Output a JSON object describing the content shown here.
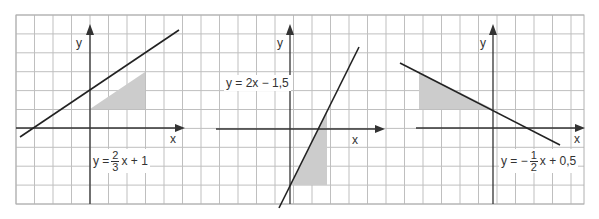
{
  "grid": {
    "left": 16,
    "top": 15,
    "right": 584,
    "bottom": 204,
    "cell_w": 18.5,
    "cell_h": 18.9,
    "line_color": "#bfbfbf",
    "border_color": "#b0b0b0"
  },
  "colors": {
    "line": "#222222",
    "axis": "#333333",
    "shade": "#cccccc"
  },
  "graphs": [
    {
      "id": "graph-1",
      "equation": "y = 2/3 x + 1",
      "label": {
        "prefix": "y = ",
        "frac_num": "2",
        "frac_den": "3",
        "suffix": "x + 1"
      },
      "axis_labels": {
        "x": "x",
        "y": "y"
      },
      "origin_px": [
        90,
        128
      ],
      "line_px": [
        [
          20,
          137
        ],
        [
          179,
          30
        ]
      ],
      "shade_px": [
        [
          90,
          109
        ],
        [
          145,
          72
        ],
        [
          145,
          109
        ]
      ]
    },
    {
      "id": "graph-2",
      "equation": "y = 2x − 1,5",
      "label": {
        "text": "y = 2x − 1,5"
      },
      "axis_labels": {
        "x": "x",
        "y": "y"
      },
      "origin_px": [
        290,
        129
      ],
      "line_px": [
        [
          279,
          208
        ],
        [
          359,
          47
        ]
      ],
      "shade_px": [
        [
          290,
          185
        ],
        [
          327,
          185
        ],
        [
          327,
          110
        ]
      ]
    },
    {
      "id": "graph-3",
      "equation": "y = −1/2 x + 0,5",
      "label": {
        "prefix": "y = −",
        "frac_num": "1",
        "frac_den": "2",
        "suffix": "x + 0,5"
      },
      "axis_labels": {
        "x": "x",
        "y": "y"
      },
      "origin_px": [
        493,
        128
      ],
      "line_px": [
        [
          400,
          63
        ],
        [
          560,
          145
        ]
      ],
      "shade_px": [
        [
          419,
          72
        ],
        [
          419,
          109
        ],
        [
          493,
          109
        ]
      ]
    }
  ]
}
